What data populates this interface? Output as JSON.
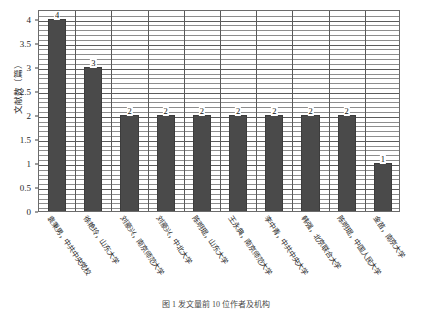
{
  "chart_data": {
    "type": "bar",
    "title": "",
    "xlabel": "",
    "ylabel": "文献数（篇）",
    "ylim": [
      0,
      4.2
    ],
    "ytick_values": [
      0,
      0.5,
      1,
      1.5,
      2,
      2.5,
      3,
      3.5,
      4
    ],
    "ytick_labels": [
      "0",
      "0.5",
      "1",
      "1.5",
      "2",
      "2.5",
      "3",
      "3.5",
      "4"
    ],
    "grid": true,
    "grid_orientation": "horizontal-minor-and-vertical-category",
    "legend": "none",
    "bar_color": "#4a4a4a",
    "categories": [
      "袁秉男，中共中央党校",
      "徐艳玲，山东大学",
      "刘豪兴，南京师范大学",
      "刘豪兴，中北大学",
      "陈明琨，山东大学",
      "王永典，南京师范大学",
      "李中青，中共中央大学",
      "韩强，北京联合大学",
      "陈明琨，中国人民大学",
      "金苗，南京大学"
    ],
    "values": [
      4,
      3,
      2,
      2,
      2,
      2,
      2,
      2,
      2,
      1
    ],
    "data_labels": [
      "4",
      "3",
      "2",
      "2",
      "2",
      "2",
      "2",
      "2",
      "2",
      "1"
    ]
  },
  "caption": "图 1  发文量前 10 位作者及机构"
}
